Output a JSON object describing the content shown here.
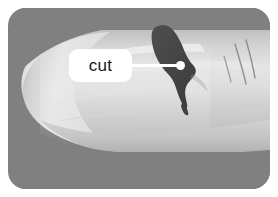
{
  "image": {
    "subject": "finger-with-cut-illustration",
    "annotation": {
      "label": "cut",
      "label_shape": "rounded-rectangle",
      "label_background": "#ffffff",
      "label_text_color": "#171717",
      "leader_line_color": "#ffffff",
      "leader_dot_color": "#ffffff"
    },
    "colors": {
      "page_background": "#ffffff",
      "scene_background": "#808080",
      "skin_light": "#dcdcdc",
      "skin_mid": "#c6c6c6",
      "skin_shadow": "#b0b0b0",
      "nail_highlight": "#ededed",
      "wound_dark": "#4a4a4a",
      "crease_line": "#8e8e8e"
    },
    "scene": {
      "corner_radius_px": 18,
      "bounds": {
        "x": 8,
        "y": 8,
        "width": 262,
        "height": 181
      }
    }
  }
}
